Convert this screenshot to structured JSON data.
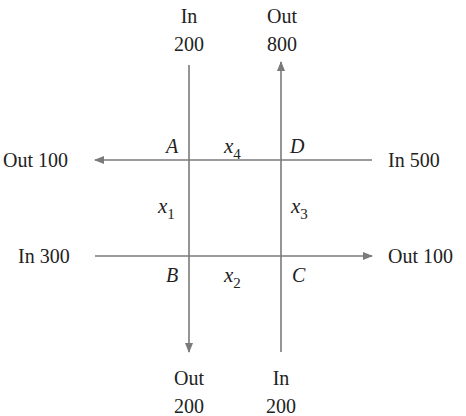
{
  "diagram": {
    "type": "traffic-flow network",
    "line_color": "#7a7a7a",
    "text_color": "#222222",
    "flows": {
      "top_left": {
        "direction": "In",
        "value": "200"
      },
      "top_right": {
        "direction": "Out",
        "value": "800"
      },
      "left_upper": {
        "label": "Out 100"
      },
      "left_lower": {
        "label": "In 300"
      },
      "right_upper": {
        "label": "In 500"
      },
      "right_lower": {
        "label": "Out 100"
      },
      "bottom_left": {
        "direction": "Out",
        "value": "200"
      },
      "bottom_right": {
        "direction": "In",
        "value": "200"
      }
    },
    "nodes": {
      "A": "A",
      "B": "B",
      "C": "C",
      "D": "D"
    },
    "variables": {
      "x1": {
        "base": "x",
        "sub": "1"
      },
      "x2": {
        "base": "x",
        "sub": "2"
      },
      "x3": {
        "base": "x",
        "sub": "3"
      },
      "x4": {
        "base": "x",
        "sub": "4"
      }
    }
  }
}
